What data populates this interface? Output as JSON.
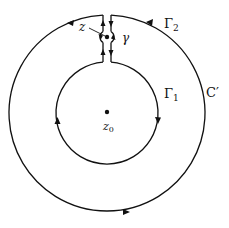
{
  "diagram": {
    "labels": {
      "z": "z",
      "gamma": "γ",
      "gamma2": "Γ",
      "gamma2_sub": "2",
      "gamma1": "Γ",
      "gamma1_sub": "1",
      "c_prime": "C′",
      "z0": "z",
      "z0_sub": "0"
    },
    "colors": {
      "stroke": "#111111",
      "background": "#ffffff"
    },
    "geometry": {
      "center": [
        107,
        113
      ],
      "outer_radius": 98,
      "inner_radius": 51,
      "small_circle_center": [
        107,
        37
      ],
      "small_circle_radius": 6,
      "gap_left_x": 103,
      "gap_right_x": 111
    }
  }
}
